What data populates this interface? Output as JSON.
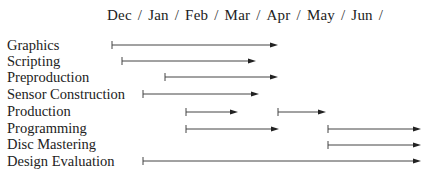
{
  "header": {
    "months": [
      "Dec",
      "Jan",
      "Feb",
      "Mar",
      "Apr",
      "May",
      "Jun"
    ],
    "separator": "/"
  },
  "tasks": [
    {
      "label": "Graphics",
      "y": 45,
      "segments": [
        [
          112,
          278
        ]
      ]
    },
    {
      "label": "Scripting",
      "y": 61,
      "segments": [
        [
          122,
          256
        ]
      ]
    },
    {
      "label": "Preproduction",
      "y": 77,
      "segments": [
        [
          165,
          278
        ]
      ]
    },
    {
      "label": "Sensor Construction",
      "y": 94,
      "segments": [
        [
          143,
          259
        ]
      ]
    },
    {
      "label": "Production",
      "y": 112,
      "segments": [
        [
          186,
          238
        ],
        [
          278,
          326
        ]
      ]
    },
    {
      "label": "Programming",
      "y": 129,
      "segments": [
        [
          186,
          279
        ],
        [
          328,
          421
        ]
      ]
    },
    {
      "label": "Disc Mastering",
      "y": 145,
      "segments": [
        [
          328,
          421
        ]
      ]
    },
    {
      "label": "Design Evaluation",
      "y": 161,
      "segments": [
        [
          143,
          421
        ]
      ]
    }
  ],
  "colors": {
    "line": "#444444",
    "text": "#222222"
  }
}
